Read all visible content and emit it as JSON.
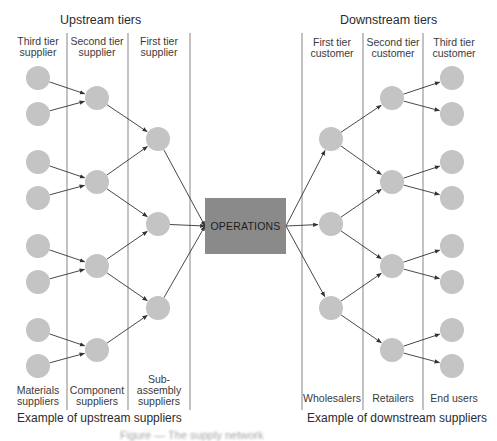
{
  "colors": {
    "node": "#c4c4c4",
    "operations": "#8a8a8a",
    "divider": "#9a9a9a",
    "arrow": "#333333"
  },
  "upstream": {
    "title": "Upstream tiers",
    "tiers": [
      {
        "label_line1": "Third tier",
        "label_line2": "supplier"
      },
      {
        "label_line1": "Second tier",
        "label_line2": "supplier"
      },
      {
        "label_line1": "First tier",
        "label_line2": "supplier"
      }
    ],
    "examples": [
      {
        "line1": "",
        "line2": "Materials",
        "line3": "suppliers"
      },
      {
        "line1": "",
        "line2": "Component",
        "line3": "suppliers"
      },
      {
        "line1": "Sub-",
        "line2": "assembly",
        "line3": "suppliers"
      }
    ],
    "example_title": "Example of upstream suppliers"
  },
  "downstream": {
    "title": "Downstream tiers",
    "tiers": [
      {
        "label_line1": "First tier",
        "label_line2": "customer"
      },
      {
        "label_line1": "Second tier",
        "label_line2": "customer"
      },
      {
        "label_line1": "Third tier",
        "label_line2": "customer"
      }
    ],
    "examples": [
      {
        "line1": "Wholesalers"
      },
      {
        "line1": "Retailers"
      },
      {
        "line1": "End users"
      }
    ],
    "example_title": "Example of downstream suppliers"
  },
  "center": {
    "label": "OPERATIONS"
  },
  "caption": "Figure — The supply network",
  "network": {
    "node_radius": 12,
    "dividers_x": [
      67,
      128,
      190,
      302,
      363,
      423
    ],
    "divider_y": [
      33,
      410
    ],
    "ops_box": {
      "x": 205,
      "y": 198,
      "w": 81,
      "h": 56
    },
    "nodes": {
      "u3": [
        [
          38,
          78
        ],
        [
          38,
          114
        ],
        [
          38,
          162
        ],
        [
          38,
          198
        ],
        [
          38,
          246
        ],
        [
          38,
          282
        ],
        [
          38,
          330
        ],
        [
          38,
          366
        ]
      ],
      "u2": [
        [
          97,
          98
        ],
        [
          97,
          182
        ],
        [
          97,
          266
        ],
        [
          97,
          350
        ]
      ],
      "u1": [
        [
          158,
          139
        ],
        [
          158,
          224
        ],
        [
          158,
          308
        ]
      ],
      "d1": [
        [
          331,
          139
        ],
        [
          331,
          224
        ],
        [
          331,
          308
        ]
      ],
      "d2": [
        [
          392,
          98
        ],
        [
          392,
          182
        ],
        [
          392,
          266
        ],
        [
          392,
          350
        ]
      ],
      "d3": [
        [
          452,
          78
        ],
        [
          452,
          114
        ],
        [
          452,
          162
        ],
        [
          452,
          198
        ],
        [
          452,
          246
        ],
        [
          452,
          282
        ],
        [
          452,
          330
        ],
        [
          452,
          366
        ]
      ]
    },
    "edges": [
      [
        "u3",
        0,
        "u2",
        0
      ],
      [
        "u3",
        1,
        "u2",
        0
      ],
      [
        "u3",
        2,
        "u2",
        1
      ],
      [
        "u3",
        3,
        "u2",
        1
      ],
      [
        "u3",
        4,
        "u2",
        2
      ],
      [
        "u3",
        5,
        "u2",
        2
      ],
      [
        "u3",
        6,
        "u2",
        3
      ],
      [
        "u3",
        7,
        "u2",
        3
      ],
      [
        "u2",
        0,
        "u1",
        0
      ],
      [
        "u2",
        1,
        "u1",
        0
      ],
      [
        "u2",
        1,
        "u1",
        1
      ],
      [
        "u2",
        2,
        "u1",
        1
      ],
      [
        "u2",
        2,
        "u1",
        2
      ],
      [
        "u2",
        3,
        "u1",
        2
      ],
      [
        "u1",
        0,
        "ops",
        0
      ],
      [
        "u1",
        1,
        "ops",
        0
      ],
      [
        "u1",
        2,
        "ops",
        0
      ],
      [
        "ops",
        0,
        "d1",
        0
      ],
      [
        "ops",
        0,
        "d1",
        1
      ],
      [
        "ops",
        0,
        "d1",
        2
      ],
      [
        "d1",
        0,
        "d2",
        0
      ],
      [
        "d1",
        0,
        "d2",
        1
      ],
      [
        "d1",
        1,
        "d2",
        1
      ],
      [
        "d1",
        1,
        "d2",
        2
      ],
      [
        "d1",
        2,
        "d2",
        2
      ],
      [
        "d1",
        2,
        "d2",
        3
      ],
      [
        "d2",
        0,
        "d3",
        0
      ],
      [
        "d2",
        0,
        "d3",
        1
      ],
      [
        "d2",
        1,
        "d3",
        2
      ],
      [
        "d2",
        1,
        "d3",
        3
      ],
      [
        "d2",
        2,
        "d3",
        4
      ],
      [
        "d2",
        2,
        "d3",
        5
      ],
      [
        "d2",
        3,
        "d3",
        6
      ],
      [
        "d2",
        3,
        "d3",
        7
      ]
    ]
  }
}
